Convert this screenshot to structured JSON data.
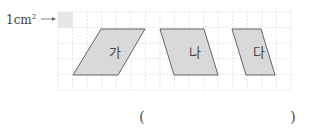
{
  "unit_label": {
    "text": "1cm",
    "superscript": "2",
    "arrow": "→"
  },
  "grid": {
    "x": 58,
    "y": 12,
    "width": 233,
    "height": 78,
    "cols": 16,
    "rows": 5,
    "line_color": "#d8d8d8",
    "unit_square_fill": "#e6e6e6"
  },
  "shapes": [
    {
      "name": "가",
      "label": "가",
      "points": "101,29 145,29 118,75 73,75",
      "label_x": 109,
      "label_y": 57
    },
    {
      "name": "나",
      "label": "나",
      "points": "160,29 204,29 218,75 174,75",
      "label_x": 189,
      "label_y": 57
    },
    {
      "name": "다",
      "label": "다",
      "points": "232,29 261,29 275,75 246,75",
      "label_x": 253,
      "label_y": 57
    }
  ],
  "shape_style": {
    "fill": "#d9d9d9",
    "stroke": "#555555"
  },
  "answer": {
    "open_paren": "(",
    "close_paren": ")",
    "value": ""
  }
}
